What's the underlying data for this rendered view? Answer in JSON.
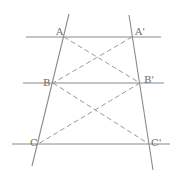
{
  "diagram": {
    "title": "",
    "colors": {
      "line": "#8a8a8a",
      "dashed": "#9a9a9a",
      "label": "#6a6a6a",
      "background": "#ffffff"
    },
    "horizontal_lines": [
      {
        "name": "line-through-A",
        "x1": 26,
        "y1": 37,
        "x2": 161,
        "y2": 37
      },
      {
        "name": "line-through-B",
        "x1": 23,
        "y1": 83,
        "x2": 164,
        "y2": 83
      },
      {
        "name": "line-through-C",
        "x1": 12,
        "y1": 144,
        "x2": 170,
        "y2": 144
      }
    ],
    "transversals": [
      {
        "name": "left-transversal",
        "x1": 69,
        "y1": 14,
        "x2": 32,
        "y2": 166
      },
      {
        "name": "right-transversal",
        "x1": 129,
        "y1": 15,
        "x2": 153,
        "y2": 170
      }
    ],
    "dashed_segments": [
      {
        "from": "A",
        "to": "B'"
      },
      {
        "from": "A'",
        "to": "B"
      },
      {
        "from": "B",
        "to": "C'"
      },
      {
        "from": "B'",
        "to": "C"
      }
    ],
    "points": {
      "A": {
        "label": "A",
        "x": 64,
        "y": 37
      },
      "A'": {
        "label": "A'",
        "x": 132,
        "y": 37
      },
      "B": {
        "label": "B",
        "x": 53,
        "y": 83
      },
      "B'": {
        "label": "B'",
        "x": 140,
        "y": 83
      },
      "C": {
        "label": "C",
        "x": 38,
        "y": 144
      },
      "C'": {
        "label": "C'",
        "x": 149,
        "y": 144
      }
    },
    "labels": {
      "A": "A",
      "A_prime": "A'",
      "B": "B",
      "B_prime": "B'",
      "C": "C",
      "C_prime": "C'"
    }
  }
}
